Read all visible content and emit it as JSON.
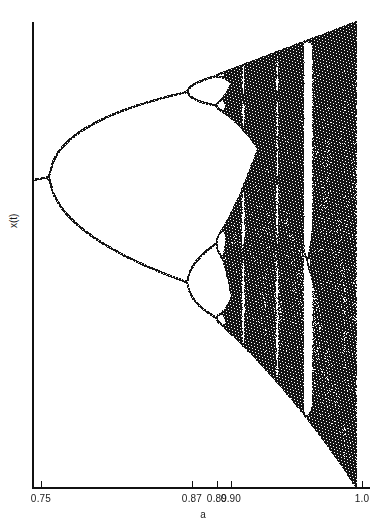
{
  "figure": {
    "name": "logistic-map-bifurcation-diagram",
    "background_color": "#ffffff",
    "ink_color": "#111111"
  },
  "axes": {
    "x_title": "a",
    "y_title": "x(t)",
    "x_ticks": [
      {
        "label": "0.75",
        "value": 0.75,
        "px": 41
      },
      {
        "label": "0.87",
        "value": 0.87,
        "px": 192
      },
      {
        "label": "0.89",
        "value": 0.89,
        "px": 217
      },
      {
        "label": "0.90",
        "value": 0.9,
        "px": 231
      },
      {
        "label": "1.0",
        "value": 1.0,
        "px": 362
      }
    ],
    "x_axis_px": {
      "left": 32,
      "right": 370,
      "y": 487
    },
    "y_axis_px": {
      "x": 32,
      "top": 22,
      "bottom": 488
    }
  },
  "chart_data": {
    "type": "scatter",
    "title": "",
    "xlabel": "a",
    "ylabel": "x(t)",
    "xlim": [
      0.736,
      1.012
    ],
    "ylim": [
      0.0,
      1.0
    ],
    "grid": false,
    "legend": null,
    "map": "logistic",
    "equation": "x(t+1) = 4*a*x(t)*(1 - x(t))",
    "parameter_symbol": "a",
    "iterations_discarded": 300,
    "iterations_plotted": 260,
    "samples_across": 1100,
    "annotations": [
      {
        "text": "0.75",
        "x": 0.75,
        "kind": "x-tick"
      },
      {
        "text": "0.87",
        "x": 0.87,
        "kind": "x-tick"
      },
      {
        "text": "0.89",
        "x": 0.89,
        "kind": "x-tick"
      },
      {
        "text": "0.90",
        "x": 0.9,
        "kind": "x-tick"
      },
      {
        "text": "1.0",
        "x": 1.0,
        "kind": "x-tick"
      }
    ],
    "bifurcation_points": [
      {
        "name": "period-1 to period-2",
        "a": 0.75
      },
      {
        "name": "period-2 to period-4",
        "a": 0.8623
      },
      {
        "name": "period-4 to period-8",
        "a": 0.886
      },
      {
        "name": "period-8 to period-16",
        "a": 0.8917
      },
      {
        "name": "accumulation (onset of chaos)",
        "a": 0.89249
      }
    ],
    "periodic_windows": [
      {
        "name": "period-3-ish window",
        "a_center": 0.9246,
        "a_width": 0.004,
        "px_center": 242
      },
      {
        "name": "period-5-ish window",
        "a_center": 0.9535,
        "a_width": 0.0043,
        "px_center": 278
      },
      {
        "name": "period-3 window (widest)",
        "a_center": 0.9825,
        "a_width": 0.0095,
        "px_center": 315
      }
    ]
  }
}
